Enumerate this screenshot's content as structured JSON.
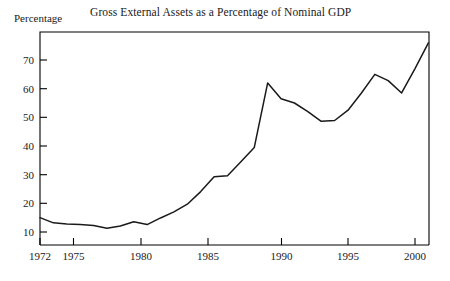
{
  "chart_data": {
    "type": "line",
    "title": "Gross External Assets as a Percentage of Nominal GDP",
    "xlabel": "",
    "ylabel": "Percentage",
    "xlim": [
      1972,
      2001
    ],
    "ylim": [
      4,
      80
    ],
    "grid": false,
    "legend": null,
    "x_tick_labels": [
      "1972",
      "1975",
      "1980",
      "1985",
      "1990",
      "1995",
      "2000"
    ],
    "x_tick_values": [
      1972,
      1975,
      1980,
      1985,
      1990,
      1995,
      2000
    ],
    "y_tick_labels": [
      "10",
      "20",
      "30",
      "40",
      "50",
      "60",
      "70"
    ],
    "y_tick_values": [
      10,
      20,
      30,
      40,
      50,
      60,
      70
    ],
    "x": [
      1972,
      1973,
      1974,
      1975,
      1976,
      1977,
      1978,
      1979,
      1980,
      1981,
      1982,
      1983,
      1984,
      1985,
      1986,
      1987,
      1988,
      1989,
      1990,
      1991,
      1992,
      1993,
      1994,
      1995,
      1996,
      1997,
      1998,
      1999,
      2000,
      2001
    ],
    "values": [
      15.0,
      13.2,
      12.8,
      12.6,
      12.3,
      11.3,
      12.1,
      13.6,
      12.6,
      14.9,
      17.0,
      19.7,
      24.1,
      29.3,
      29.6,
      34.5,
      39.5,
      62.0,
      56.5,
      55.0,
      52.0,
      48.6,
      48.9,
      52.5,
      58.5,
      65.0,
      62.8,
      58.5,
      67.0,
      76.0
    ],
    "series": [
      {
        "name": "Gross External Assets (% of Nominal GDP)",
        "values": [
          15.0,
          13.2,
          12.8,
          12.6,
          12.3,
          11.3,
          12.1,
          13.6,
          12.6,
          14.9,
          17.0,
          19.7,
          24.1,
          29.3,
          29.6,
          34.5,
          39.5,
          62.0,
          56.5,
          55.0,
          52.0,
          48.6,
          48.9,
          52.5,
          58.5,
          65.0,
          62.8,
          58.5,
          67.0,
          76.0
        ]
      }
    ]
  }
}
